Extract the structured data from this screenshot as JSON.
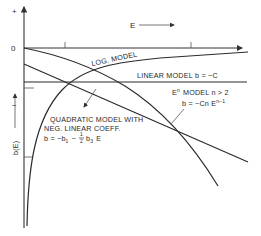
{
  "figure": {
    "y_axis": {
      "plus_label": "+",
      "zero_label": "0",
      "minus_label": "−",
      "title": "b(E)"
    },
    "x_axis": {
      "title": "E"
    },
    "curves": {
      "log_model": {
        "label": "LOG. MODEL"
      },
      "linear_model": {
        "label": "LINEAR MODEL",
        "formula": "b = −C"
      },
      "en_model": {
        "label_base": "E",
        "label_exp": "n",
        "label_rest": "MODEL  n > 2",
        "formula_base": "b = −Cn E",
        "formula_exp": "n−1"
      },
      "quadratic_model": {
        "line1": "QUADRATIC  MODEL  WITH",
        "line2": "NEG. LINEAR  COEFF.",
        "formula_prefix": "b = −b",
        "formula_sub1": "1",
        "formula_mid": "−",
        "frac_num": "1",
        "frac_den": "2",
        "formula_b": "b",
        "formula_sub3": "3",
        "formula_end": "E"
      }
    },
    "colors": {
      "line": "#2b2b2b",
      "background": "#ffffff"
    }
  }
}
